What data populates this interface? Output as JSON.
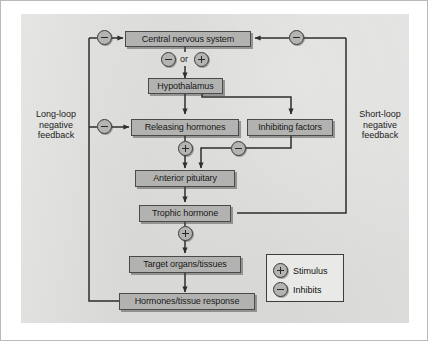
{
  "figure": {
    "watermark": "· ···· ·"
  },
  "nodes": {
    "cns": "Central nervous system",
    "hypothalamus": "Hypothalamus",
    "releasing": "Releasing hormones",
    "inhibiting": "Inhibiting factors",
    "pituitary": "Anterior pituitary",
    "trophic": "Trophic hormone",
    "target": "Target organs/tissues",
    "response": "Hormones/tissue response"
  },
  "captions": {
    "long_loop": "Long-loop\nnegative\nfeedback",
    "short_loop": "Short-loop\nnegative\nfeedback",
    "or": "or"
  },
  "legend": {
    "title": "Key",
    "items": [
      {
        "symbol": "plus",
        "label": "Stimulus"
      },
      {
        "symbol": "minus",
        "label": "Inhibits"
      }
    ]
  },
  "tokens": {
    "cns_long_loop_inhibit": "minus",
    "cns_short_loop_inhibit": "minus",
    "cns_out_minus": "minus",
    "cns_out_plus": "plus",
    "releasing_long_loop_inhibit": "minus",
    "releasing_plus": "plus",
    "inhibiting_minus": "minus",
    "trophic_plus": "plus"
  },
  "colors": {
    "plate_background": "#d8d8d6",
    "node_fill": "#b2b2b0",
    "node_border": "#4a4a4a",
    "token_fill": "#b4b4b2",
    "legend_fill": "#e9e9e7",
    "wire": "#2e2e2e",
    "page": "#ffffff",
    "frame": "#b9b9b9"
  }
}
